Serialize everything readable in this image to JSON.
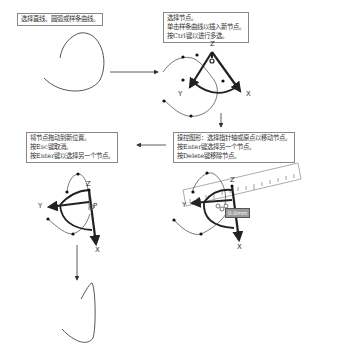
{
  "steps": [
    {
      "id": "step1",
      "lines": [
        "选择直线、圆弧或样条曲线。"
      ]
    },
    {
      "id": "step2",
      "lines": [
        "选择节点。",
        "单击样条曲线以插入新节点。",
        "按Ctrl键以进行多选。"
      ]
    },
    {
      "id": "step3",
      "lines": [
        "操控图形：选择指针轴或原点以移动节点。",
        "按Enter键选择另一个节点。",
        "按Delete键移除节点。"
      ]
    },
    {
      "id": "step4",
      "lines": [
        "将节点拖动到新位置。",
        "按Esc键取消。",
        "按Enter键以选择另一个节点。"
      ]
    }
  ],
  "axis_labels": {
    "x": "X",
    "y": "Y",
    "z": "Z"
  },
  "distance_tag": "0.0mm",
  "colors": {
    "line": "#333333",
    "border": "#888888",
    "tag_bg": "#9a9a9a"
  }
}
